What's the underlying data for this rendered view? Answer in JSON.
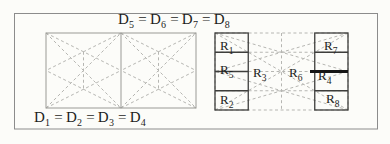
{
  "figure_type": "geometric-dissection-diagram",
  "colors": {
    "dash": "#b6b6b2",
    "left-border": "#9a9a96",
    "box-border": "#3e3e3c",
    "thick": "#161616",
    "frame": "#8c8c8c",
    "label": "#1c1c1c",
    "bg": "#fcfcf9"
  },
  "equations": {
    "top": {
      "sep": "=",
      "t1": {
        "base": "D",
        "sub": "5"
      },
      "t2": {
        "base": "D",
        "sub": "6"
      },
      "t3": {
        "base": "D",
        "sub": "7"
      },
      "t4": {
        "base": "D",
        "sub": "8"
      }
    },
    "bottom": {
      "sep": "=",
      "t1": {
        "base": "D",
        "sub": "1"
      },
      "t2": {
        "base": "D",
        "sub": "2"
      },
      "t3": {
        "base": "D",
        "sub": "3"
      },
      "t4": {
        "base": "D",
        "sub": "4"
      }
    }
  },
  "regions": {
    "r1": {
      "base": "R",
      "sub": "1"
    },
    "r2": {
      "base": "R",
      "sub": "2"
    },
    "r3": {
      "base": "R",
      "sub": "3"
    },
    "r4": {
      "base": "R",
      "sub": "4"
    },
    "r5": {
      "base": "R",
      "sub": "5"
    },
    "r6": {
      "base": "R",
      "sub": "6"
    },
    "r7": {
      "base": "R",
      "sub": "7"
    },
    "r8": {
      "base": "R",
      "sub": "8"
    }
  }
}
